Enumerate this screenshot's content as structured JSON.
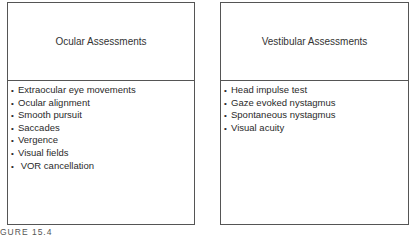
{
  "boxes": [
    {
      "title": "Ocular Assessments",
      "items": [
        "Extraocular eye movements",
        "Ocular alignment",
        "Smooth pursuit",
        "Saccades",
        "Vergence",
        "Visual fields",
        " VOR cancellation"
      ]
    },
    {
      "title": "Vestibular Assessments",
      "items": [
        "Head impulse test",
        "Gaze evoked nystagmus",
        "Spontaneous nystagmus",
        "Visual acuity"
      ]
    }
  ],
  "caption": "GURE 15.4"
}
